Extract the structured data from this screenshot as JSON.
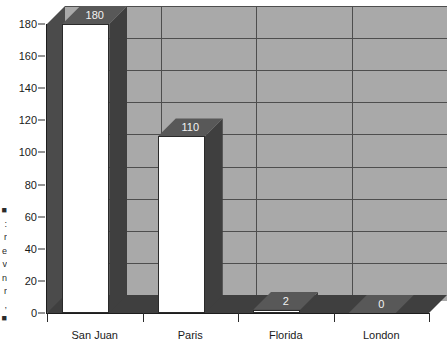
{
  "chart_data": {
    "type": "bar",
    "title": "",
    "xlabel": "",
    "ylabel": "",
    "categories": [
      "San Juan",
      "Paris",
      "Florida",
      "London"
    ],
    "values": [
      180,
      110,
      2,
      0
    ],
    "data_labels": [
      "180",
      "110",
      "2",
      "0"
    ],
    "ylim": [
      0,
      190
    ],
    "yticks": [
      0,
      20,
      40,
      60,
      80,
      100,
      120,
      140,
      160,
      180
    ],
    "ytick_labels": [
      "0",
      "20",
      "40",
      "60",
      "80",
      "100",
      "120",
      "140",
      "160",
      "180"
    ],
    "grid": "horizontal-and-vertical",
    "legend": "none",
    "style": "3d-bar",
    "colors": {
      "bar_front": "#ffffff",
      "bar_side": "#3f3f3f",
      "bar_top": "#585858",
      "back_wall": "#a9a9a9",
      "left_wall": "#4b4b4b",
      "floor": "#3f3f3f",
      "gridline": "#4e4e4e",
      "axis": "#1d1d1d",
      "label_text": "#1a1a1a",
      "value_text": "#f2f2f2",
      "background": "#ffffff"
    }
  },
  "edge_text": "■\n:\nr\ne\nv\nn\nr\n,\n■"
}
